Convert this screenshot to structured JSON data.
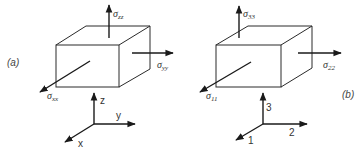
{
  "figure": {
    "panel_a": {
      "label": "(a)",
      "stress_labels": {
        "top": {
          "symbol": "σ",
          "sub": "zz"
        },
        "right": {
          "symbol": "σ",
          "sub": "yy"
        },
        "front": {
          "symbol": "σ",
          "sub": "xx"
        }
      },
      "axes": {
        "up": "z",
        "right": "y",
        "diag": "x"
      }
    },
    "panel_b": {
      "label": "(b)",
      "stress_labels": {
        "top": {
          "symbol": "σ",
          "sub": "33"
        },
        "right": {
          "symbol": "σ",
          "sub": "22"
        },
        "front": {
          "symbol": "σ",
          "sub": "11"
        }
      },
      "axes": {
        "up": "3",
        "right": "2",
        "diag": "1"
      }
    },
    "colors": {
      "line": "#2a2a2a",
      "text": "#333333",
      "background": "#ffffff"
    }
  }
}
